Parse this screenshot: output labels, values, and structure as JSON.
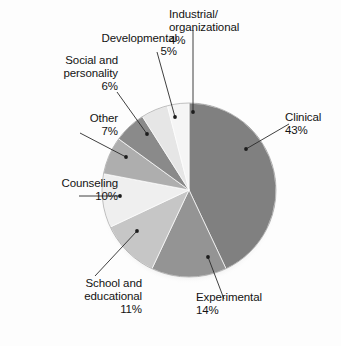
{
  "title_remnant": "",
  "chart_data": {
    "type": "pie",
    "title": "",
    "subtitle": "",
    "xlabel": "",
    "ylabel": "",
    "legend_position": "none",
    "grid": false,
    "units": "percent",
    "start_angle_deg": 0,
    "direction": "clockwise",
    "categories": [
      "Clinical",
      "Experimental",
      "School and educational",
      "Counseling",
      "Other",
      "Social and personality",
      "Developmental",
      "Industrial/organizational"
    ],
    "values": [
      43,
      14,
      11,
      10,
      7,
      6,
      5,
      4
    ],
    "slices": [
      {
        "label": "Clinical",
        "label_lines": "Clinical",
        "value": 43,
        "value_label": "43%",
        "color": "#808080"
      },
      {
        "label": "Experimental",
        "label_lines": "Experimental",
        "value": 14,
        "value_label": "14%",
        "color": "#949494"
      },
      {
        "label": "School and educational",
        "label_lines": "School and\neducational",
        "value": 11,
        "value_label": "11%",
        "color": "#c6c6c6"
      },
      {
        "label": "Counseling",
        "label_lines": "Counseling",
        "value": 10,
        "value_label": "10%",
        "color": "#efefef"
      },
      {
        "label": "Other",
        "label_lines": "Other",
        "value": 7,
        "value_label": "7%",
        "color": "#aeaeae"
      },
      {
        "label": "Social and personality",
        "label_lines": "Social and\npersonality",
        "value": 6,
        "value_label": "6%",
        "color": "#8a8a8a"
      },
      {
        "label": "Developmental",
        "label_lines": "Developmental",
        "value": 5,
        "value_label": "5%",
        "color": "#e6e6e6"
      },
      {
        "label": "Industrial/organizational",
        "label_lines": "Industrial/\norganizational",
        "value": 4,
        "value_label": "4%",
        "color": "#f5f5f5"
      }
    ]
  },
  "labels": {
    "industrial": {
      "name": "Industrial/\norganizational",
      "pct": "4%"
    },
    "developmental": {
      "name": "Developmental",
      "pct": "5%"
    },
    "social": {
      "name": "Social and\npersonality",
      "pct": "6%"
    },
    "other": {
      "name": "Other",
      "pct": "7%"
    },
    "counseling": {
      "name": "Counseling",
      "pct": "10%"
    },
    "school": {
      "name": "School and\neducational",
      "pct": "11%"
    },
    "experimental": {
      "name": "Experimental",
      "pct": "14%"
    },
    "clinical": {
      "name": "Clinical",
      "pct": "43%"
    }
  },
  "colors": {
    "background": "#fdfdfd",
    "text": "#131313",
    "leader_line": "#2a2a2a",
    "pie_edge": "#6f6f6f",
    "shadow": "#d5d5d5"
  }
}
